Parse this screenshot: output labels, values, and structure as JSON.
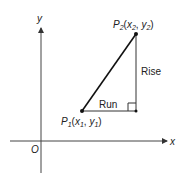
{
  "diagram": {
    "axes": {
      "x_label": "x",
      "y_label": "y",
      "origin_label": "O"
    },
    "points": {
      "p1": {
        "name": "P",
        "sub": "1",
        "open": "(",
        "x": "x",
        "x_sub": "1",
        "sep": ", ",
        "y": "y",
        "y_sub": "1",
        "close": ")"
      },
      "p2": {
        "name": "P",
        "sub": "2",
        "open": "(",
        "x": "x",
        "x_sub": "2",
        "sep": ", ",
        "y": "y",
        "y_sub": "2",
        "close": ")"
      }
    },
    "legs": {
      "rise_label": "Rise",
      "run_label": "Run"
    },
    "colors": {
      "ink": "#222222",
      "background": "#ffffff"
    }
  }
}
